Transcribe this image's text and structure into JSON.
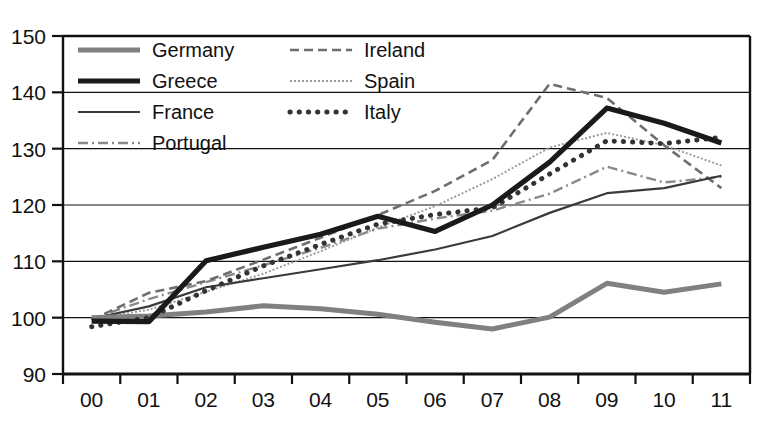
{
  "chart_data": {
    "type": "line",
    "title": "",
    "subtitle": "",
    "xlabel": "",
    "ylabel": "",
    "x": [
      "00",
      "01",
      "02",
      "03",
      "04",
      "05",
      "06",
      "07",
      "08",
      "09",
      "10",
      "11"
    ],
    "xtick_labels": [
      "00",
      "01",
      "02",
      "03",
      "04",
      "05",
      "06",
      "07",
      "08",
      "09",
      "10",
      "11"
    ],
    "ytick_labels": [
      "90",
      "100",
      "110",
      "120",
      "130",
      "140",
      "150"
    ],
    "yticks": [
      90,
      100,
      110,
      120,
      130,
      140,
      150
    ],
    "ylim": [
      90,
      150
    ],
    "grid": "horizontal",
    "legend_position": "top-left inside plot, two columns",
    "series": [
      {
        "name": "Germany",
        "style": "thick-solid-gray",
        "color": "#808080",
        "width": 5.0,
        "dash": "none",
        "values": [
          100.0,
          100.3,
          101.0,
          102.1,
          101.6,
          100.6,
          99.2,
          98.0,
          100.1,
          106.1,
          104.5,
          106.0
        ]
      },
      {
        "name": "Greece",
        "style": "thick-solid-black",
        "color": "#1a1a1a",
        "width": 5.2,
        "dash": "none",
        "values": [
          99.4,
          99.3,
          110.1,
          112.5,
          114.8,
          118.0,
          115.3,
          120.0,
          127.6,
          137.2,
          134.5,
          131.0
        ]
      },
      {
        "name": "France",
        "style": "thin-solid-dark",
        "color": "#3a3a3a",
        "width": 2.2,
        "dash": "none",
        "values": [
          99.8,
          102.0,
          105.4,
          107.0,
          108.6,
          110.2,
          112.1,
          114.5,
          118.6,
          122.1,
          123.0,
          125.2
        ]
      },
      {
        "name": "Portugal",
        "style": "dash-dot-gray",
        "color": "#8a8a8a",
        "width": 2.4,
        "dash": "10 4 2 4",
        "values": [
          99.8,
          103.3,
          106.3,
          109.3,
          112.4,
          115.8,
          117.6,
          119.0,
          122.0,
          126.8,
          124.0,
          125.0
        ]
      },
      {
        "name": "Ireland",
        "style": "dashed-gray",
        "color": "#6e6e6e",
        "width": 2.6,
        "dash": "9 5",
        "values": [
          99.6,
          104.4,
          106.5,
          110.3,
          114.2,
          118.2,
          122.5,
          128.0,
          141.5,
          139.0,
          130.6,
          123.0
        ]
      },
      {
        "name": "Spain",
        "style": "fine-dotted-gray",
        "color": "#9a9a9a",
        "width": 1.9,
        "dash": "2 2",
        "values": [
          99.7,
          101.4,
          104.6,
          107.8,
          111.8,
          116.0,
          119.8,
          124.6,
          130.2,
          132.8,
          130.6,
          127.0
        ]
      },
      {
        "name": "Italy",
        "style": "thick-dotted-dark",
        "color": "#333333",
        "width": 5.0,
        "dash": "0.2 9",
        "values": [
          98.4,
          100.0,
          104.8,
          109.2,
          113.0,
          116.6,
          118.3,
          119.5,
          125.5,
          131.4,
          130.9,
          132.0
        ]
      }
    ]
  },
  "legend": {
    "columns": [
      [
        {
          "label": "Germany",
          "series": "Germany"
        },
        {
          "label": "Greece",
          "series": "Greece"
        },
        {
          "label": "France",
          "series": "France"
        },
        {
          "label": "Portugal",
          "series": "Portugal"
        }
      ],
      [
        {
          "label": "Ireland",
          "series": "Ireland"
        },
        {
          "label": "Spain",
          "series": "Spain"
        },
        {
          "label": "Italy",
          "series": "Italy"
        }
      ]
    ]
  }
}
